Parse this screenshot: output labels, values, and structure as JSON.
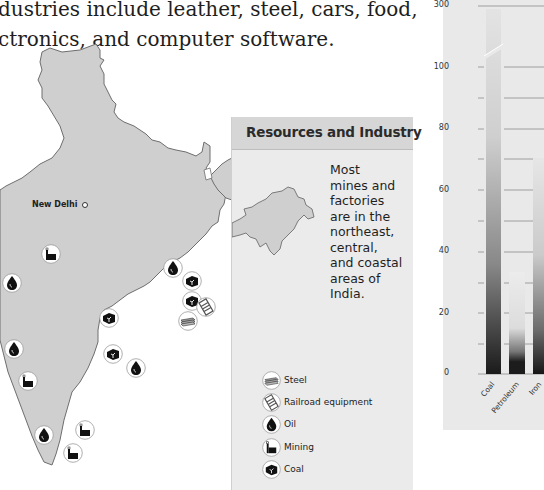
{
  "intro_text": {
    "line1": "dustries include leather, steel, cars, food,",
    "line2": "ctronics, and computer software."
  },
  "map": {
    "city_label": "New Delhi",
    "markers": [
      {
        "type": "mining",
        "x": 41,
        "y": 244
      },
      {
        "type": "oil",
        "x": 2,
        "y": 273
      },
      {
        "type": "oil",
        "x": 163,
        "y": 258
      },
      {
        "type": "coal",
        "x": 182,
        "y": 271
      },
      {
        "type": "coal",
        "x": 182,
        "y": 291
      },
      {
        "type": "railroad",
        "x": 196,
        "y": 297
      },
      {
        "type": "steel",
        "x": 178,
        "y": 311
      },
      {
        "type": "coal",
        "x": 99,
        "y": 308
      },
      {
        "type": "coal",
        "x": 103,
        "y": 344
      },
      {
        "type": "oil",
        "x": 4,
        "y": 339
      },
      {
        "type": "oil",
        "x": 126,
        "y": 358
      },
      {
        "type": "mining",
        "x": 18,
        "y": 371
      },
      {
        "type": "oil",
        "x": 34,
        "y": 425
      },
      {
        "type": "mining",
        "x": 75,
        "y": 420
      },
      {
        "type": "mining",
        "x": 63,
        "y": 443
      }
    ]
  },
  "panel": {
    "title": "Resources and Industry",
    "text_lines": [
      "Most",
      "mines and",
      "factories",
      "are in the",
      "northeast,",
      "central,",
      "and coastal",
      "areas of",
      "India."
    ]
  },
  "legend": {
    "items": [
      {
        "icon": "steel",
        "label": "Steel"
      },
      {
        "icon": "railroad",
        "label": "Railroad equipment"
      },
      {
        "icon": "oil",
        "label": "Oil"
      },
      {
        "icon": "mining",
        "label": "Mining"
      },
      {
        "icon": "coal",
        "label": "Coal"
      }
    ]
  },
  "chart_data": {
    "type": "bar",
    "title": "",
    "xlabel": "",
    "ylabel": "",
    "categories": [
      "Coal",
      "Petroleum",
      "Iron",
      "S..."
    ],
    "values": [
      290,
      33,
      71,
      null
    ],
    "yticks": [
      0,
      20,
      40,
      60,
      80,
      100,
      300
    ],
    "axis_break": "between 100 and 300",
    "grid": true,
    "note": "Chart cropped at right edge; fourth category partially visible"
  },
  "chart_labels": {
    "y": [
      "300",
      "100",
      "80",
      "60",
      "40",
      "20",
      "0"
    ],
    "x": [
      "Coal",
      "Petroleum",
      "Iron",
      "St"
    ]
  }
}
